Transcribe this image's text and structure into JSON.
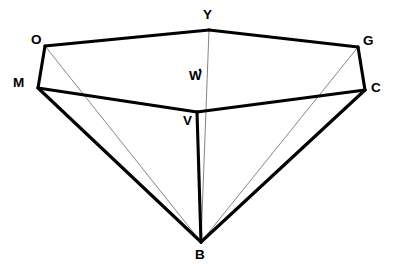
{
  "figure": {
    "canvas": {
      "width": 403,
      "height": 275,
      "background": "#ffffff"
    },
    "style": {
      "thick_stroke_color": "#000000",
      "thick_stroke_width": 3.1,
      "thin_stroke_color": "#6f6f6f",
      "thin_stroke_width": 0.85,
      "label_color": "#000000",
      "label_font_size": 13.5,
      "label_weight": "bold"
    },
    "vertices": [
      {
        "id": "O",
        "label": "O",
        "x": 45,
        "y": 46,
        "label_x": 31,
        "label_y": 33,
        "marker": false
      },
      {
        "id": "Y",
        "label": "Y",
        "x": 209,
        "y": 30,
        "label_x": 203,
        "label_y": 8,
        "marker": false
      },
      {
        "id": "G",
        "label": "G",
        "x": 358,
        "y": 47,
        "label_x": 363,
        "label_y": 34,
        "marker": false
      },
      {
        "id": "M",
        "label": "M",
        "x": 38,
        "y": 88,
        "label_x": 13,
        "label_y": 76,
        "marker": false
      },
      {
        "id": "C",
        "label": "C",
        "x": 365,
        "y": 90,
        "label_x": 371,
        "label_y": 81,
        "marker": false
      },
      {
        "id": "W",
        "label": "W",
        "x": 200,
        "y": 70,
        "label_x": 189,
        "label_y": 69,
        "marker": true
      },
      {
        "id": "V",
        "label": "V",
        "x": 197,
        "y": 112,
        "label_x": 183,
        "label_y": 114,
        "marker": false
      },
      {
        "id": "B",
        "label": "B",
        "x": 201,
        "y": 242,
        "label_x": 195,
        "label_y": 248,
        "marker": false
      }
    ],
    "edges_thick": [
      {
        "from": "O",
        "to": "Y",
        "name": "edge-O-Y"
      },
      {
        "from": "Y",
        "to": "G",
        "name": "edge-Y-G"
      },
      {
        "from": "O",
        "to": "M",
        "name": "edge-O-M"
      },
      {
        "from": "G",
        "to": "C",
        "name": "edge-G-C"
      },
      {
        "from": "M",
        "to": "V",
        "name": "edge-M-V"
      },
      {
        "from": "V",
        "to": "C",
        "name": "edge-V-C"
      },
      {
        "from": "M",
        "to": "B",
        "name": "edge-M-B"
      },
      {
        "from": "C",
        "to": "B",
        "name": "edge-C-B"
      },
      {
        "from": "V",
        "to": "B",
        "name": "edge-V-B"
      }
    ],
    "edges_thin": [
      {
        "from": "O",
        "to": "B",
        "name": "edge-O-B"
      },
      {
        "from": "G",
        "to": "B",
        "name": "edge-G-B"
      },
      {
        "from": "Y",
        "to": "B",
        "name": "edge-Y-B"
      }
    ]
  }
}
